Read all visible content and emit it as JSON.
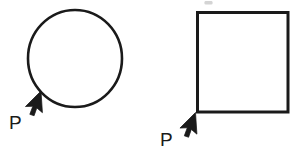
{
  "figure": {
    "background_color": "#ffffff",
    "stroke_color": "#1a1a1a",
    "width": 300,
    "height": 157,
    "shapes": [
      {
        "name": "circle",
        "kind": "circle",
        "center_x": 75,
        "center_y": 58.5,
        "radius_x": 47,
        "radius_y": 48.5,
        "stroke_width": 2.6,
        "fill": "none"
      },
      {
        "name": "square",
        "kind": "rectangle",
        "x": 196,
        "y": 11,
        "width": 93,
        "height": 102,
        "stroke_width": 3.0,
        "fill": "none"
      }
    ],
    "pointers": [
      {
        "name": "circle-pointer",
        "label": "P",
        "tip_x": 41,
        "tip_y": 91,
        "direction": "up-right",
        "target": "circle"
      },
      {
        "name": "square-pointer",
        "label": "P",
        "tip_x": 196,
        "tip_y": 112,
        "direction": "up-right",
        "target": "square"
      }
    ],
    "artifacts": [
      {
        "name": "scan-smudge",
        "x": 204,
        "y": 1,
        "width": 9,
        "height": 4
      }
    ],
    "labels": {
      "p_circle": "P",
      "p_square": "P"
    }
  }
}
